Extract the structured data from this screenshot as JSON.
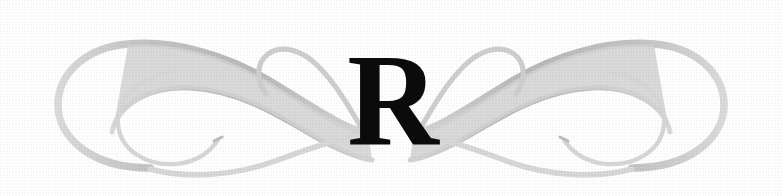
{
  "canvas": {
    "width": 782,
    "height": 196,
    "background_color": "#ffffff"
  },
  "ornament": {
    "type": "calligraphic-divider-with-dropcap",
    "description": "Symmetric engraved book ornament: two mirrored S-shaped flourishes with spiral terminals flanking a serif capital letter",
    "stroke_color": "#c9c9c9",
    "stroke_color_dark": "#a9a9a9",
    "stroke_color_light": "#dedede",
    "symmetry": "horizontal-mirror",
    "left_flourish_label": "left-scroll-flourish",
    "right_flourish_label": "right-scroll-flourish"
  },
  "dropcap": {
    "letter": "R",
    "color": "#0b0b0b",
    "style": "serif-capital"
  }
}
